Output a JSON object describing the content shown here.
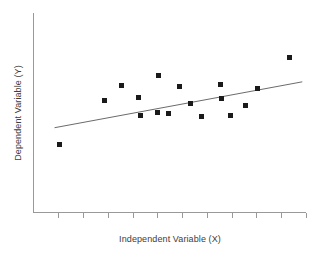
{
  "chart_data": {
    "type": "scatter",
    "title": "",
    "xlabel": "Independent Variable (X)",
    "ylabel": "Dependent Variable (Y)",
    "xlim": [
      0,
      11
    ],
    "ylim": [
      0,
      10
    ],
    "grid": false,
    "legend": null,
    "marker": {
      "shape": "square",
      "color": "#1a1a1a",
      "size_px": 5
    },
    "x_ticks": {
      "count": 11,
      "labels": [],
      "positions": [
        1,
        2,
        3,
        4,
        5,
        6,
        7,
        8,
        9,
        10,
        11
      ]
    },
    "y_ticks": {
      "count": 0,
      "labels": []
    },
    "points": [
      {
        "x": 1.05,
        "y": 3.4
      },
      {
        "x": 2.85,
        "y": 5.63
      },
      {
        "x": 3.55,
        "y": 6.35
      },
      {
        "x": 4.25,
        "y": 5.78
      },
      {
        "x": 4.3,
        "y": 4.85
      },
      {
        "x": 5.05,
        "y": 6.85
      },
      {
        "x": 5.0,
        "y": 5.0
      },
      {
        "x": 5.45,
        "y": 4.95
      },
      {
        "x": 5.9,
        "y": 6.3
      },
      {
        "x": 6.35,
        "y": 5.45
      },
      {
        "x": 6.8,
        "y": 4.8
      },
      {
        "x": 7.55,
        "y": 6.4
      },
      {
        "x": 7.6,
        "y": 5.7
      },
      {
        "x": 7.95,
        "y": 4.85
      },
      {
        "x": 8.55,
        "y": 5.35
      },
      {
        "x": 9.05,
        "y": 6.2
      },
      {
        "x": 10.35,
        "y": 7.75
      }
    ],
    "trend_line": {
      "type": "linear-fit",
      "color": "#6b6b6b",
      "x_start": 0.85,
      "y_start": 4.25,
      "x_end": 10.85,
      "y_end": 6.55
    }
  },
  "figure": {
    "background_color": "#ffffff",
    "axis_color": "#999999",
    "text_color": "#3d3d3d"
  }
}
